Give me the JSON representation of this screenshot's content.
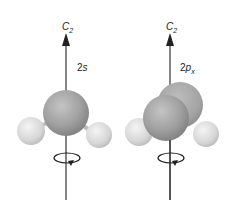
{
  "panels": [
    {
      "axis_label": "C",
      "axis_sub": "2",
      "orbital_label": "2s",
      "orbital_main": "2",
      "orbital_letter": "s",
      "orbital_sub": ""
    },
    {
      "axis_label": "C",
      "axis_sub": "2",
      "orbital_label": "2px",
      "orbital_main": "2",
      "orbital_letter": "p",
      "orbital_sub": "x"
    }
  ],
  "colors": {
    "central": "#9a9a9a",
    "hydrogen": "#d8d8d8",
    "axis": "#333333"
  }
}
